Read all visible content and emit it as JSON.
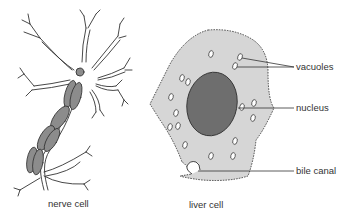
{
  "diagram": {
    "cells": [
      {
        "id": "nerve",
        "caption": "nerve cell"
      },
      {
        "id": "liver",
        "caption": "liver cell"
      }
    ],
    "labels": {
      "vacuoles": "vacuoles",
      "nucleus": "nucleus",
      "bile_canal": "bile canal"
    },
    "colors": {
      "cytoplasm": "#d6d6d6",
      "nucleus": "#6e6e6e",
      "myelin": "#8c8c8c",
      "outline": "#333333",
      "text": "#333333"
    }
  }
}
